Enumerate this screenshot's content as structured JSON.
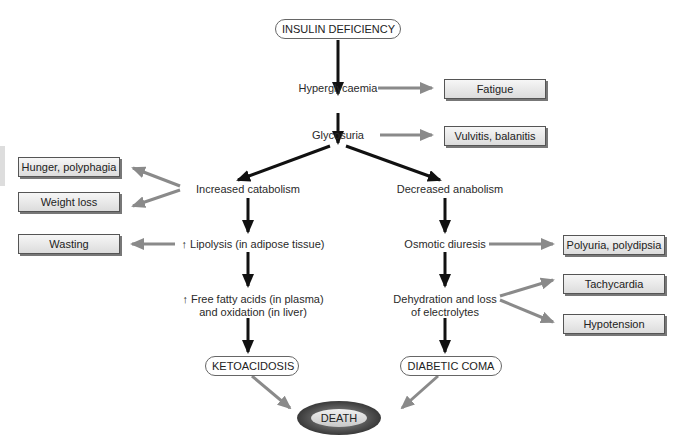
{
  "diagram": {
    "root": "INSULIN DEFICIENCY",
    "nodes": {
      "hyperglycaemia": "Hyperglycaemia",
      "glycosuria": "Glycosuria",
      "increased_catabolism": "Increased catabolism",
      "decreased_anabolism": "Decreased anabolism",
      "lipolysis": "↑ Lipolysis (in adipose tissue)",
      "ffa_line1": "↑ Free fatty acids (in plasma)",
      "ffa_line2": "and oxidation (in liver)",
      "osmotic_diuresis": "Osmotic diuresis",
      "dehydration_line1": "Dehydration and loss",
      "dehydration_line2": "of electrolytes",
      "ketoacidosis": "KETOACIDOSIS",
      "diabetic_coma": "DIABETIC COMA",
      "death": "DEATH"
    },
    "effects": {
      "fatigue": "Fatigue",
      "vulvitis": "Vulvitis, balanitis",
      "hunger": "Hunger, polyphagia",
      "weight_loss": "Weight loss",
      "wasting": "Wasting",
      "polyuria": "Polyuria, polydipsia",
      "tachycardia": "Tachycardia",
      "hypotension": "Hypotension"
    },
    "colors": {
      "main_arrow": "#111111",
      "effect_arrow": "#8a8a8a",
      "box_border": "#555555"
    }
  }
}
